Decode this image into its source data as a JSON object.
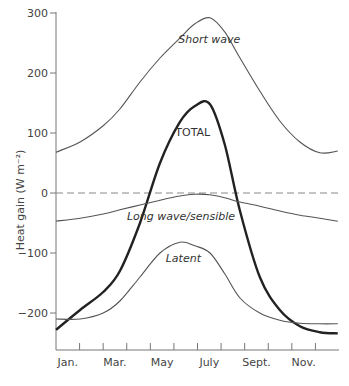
{
  "chart_data": {
    "type": "line",
    "title": "",
    "xlabel": "",
    "ylabel": "Heat gain (W m⁻²)",
    "ylim": [
      -270,
      300
    ],
    "yticks": [
      300,
      200,
      100,
      0,
      -100,
      -200
    ],
    "xtick_labels": [
      "Jan.",
      "Mar.",
      "May",
      "July",
      "Sept.",
      "Nov."
    ],
    "x_domain_months": [
      0,
      12
    ],
    "grid": false,
    "legend": "inline labels",
    "x": [
      0.0,
      1.02,
      2.0,
      2.71,
      3.56,
      4.41,
      5.25,
      5.89,
      6.53,
      7.16,
      7.8,
      8.64,
      9.49,
      10.34,
      11.19,
      11.95
    ],
    "series": [
      {
        "name": "Short wave",
        "style": "thin",
        "values": [
          68,
          85,
          112,
          140,
          185,
          225,
          258,
          282,
          292,
          268,
          225,
          170,
          120,
          85,
          67,
          70
        ]
      },
      {
        "name": "TOTAL",
        "style": "bold",
        "values": [
          -228,
          -195,
          -165,
          -130,
          -50,
          50,
          118,
          145,
          148,
          80,
          -30,
          -140,
          -195,
          -222,
          -232,
          -234
        ]
      },
      {
        "name": "Long wave/sensible",
        "style": "thin",
        "values": [
          -47,
          -42,
          -35,
          -28,
          -20,
          -12,
          -5,
          -2,
          -3,
          -8,
          -15,
          -22,
          -30,
          -37,
          -42,
          -47
        ]
      },
      {
        "name": "Latent",
        "style": "thin",
        "values": [
          -210,
          -210,
          -200,
          -180,
          -140,
          -100,
          -82,
          -88,
          -100,
          -135,
          -175,
          -200,
          -212,
          -217,
          -218,
          -218
        ]
      }
    ],
    "reference_line": {
      "y": 0,
      "style": "dashed"
    },
    "annotations": [
      {
        "text": "Short wave",
        "x_month": 6.5,
        "y": 250
      },
      {
        "text": "TOTAL",
        "x_month": 5.8,
        "y": 95
      },
      {
        "text": "Long wave/sensible",
        "x_month": 5.3,
        "y": -45
      },
      {
        "text": "Latent",
        "x_month": 5.4,
        "y": -115
      }
    ]
  }
}
